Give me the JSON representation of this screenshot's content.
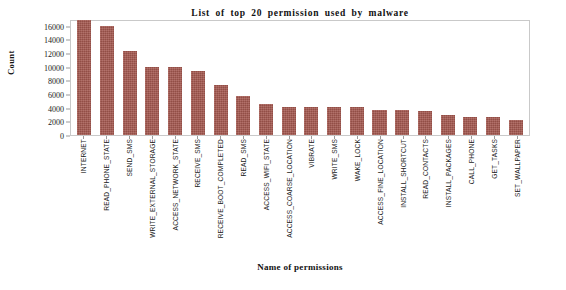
{
  "figure": {
    "background_color": "#ffffff",
    "frame_color": "#c9c9c9"
  },
  "chart_data": {
    "type": "bar",
    "title": "List  of  top  20  permission  used  by  malware",
    "xlabel": "Name of permissions",
    "ylabel": "Count",
    "ylim": [
      0,
      17000
    ],
    "yticks": [
      0,
      2000,
      4000,
      6000,
      8000,
      10000,
      12000,
      14000,
      16000
    ],
    "ytick_labels": [
      "0",
      "2000",
      "4000",
      "6000",
      "8000",
      "10000",
      "12000",
      "14000",
      "16000"
    ],
    "grid": false,
    "legend": null,
    "bar_color": "#a4574f",
    "categories": [
      "INTERNET",
      "READ_PHONE_STATE",
      "SEND_SMS",
      "WRITE_EXTERNAL_STORAGE",
      "ACCESS_NETWORK_STATE",
      "RECEIVE_SMS",
      "RECEIVE_BOOT_COMPLETED",
      "READ_SMS",
      "ACCESS_WIFI_STATE",
      "ACCESS_COARSE_LOCATION",
      "VIBRATE",
      "WRITE_SMS",
      "WAKE_LOCK",
      "ACCESS_FINE_LOCATION",
      "INSTALL_SHORTCUT",
      "READ_CONTACTS",
      "INSTALL_PACKAGES",
      "CALL_PHONE",
      "GET_TASKS",
      "SET_WALLPAPER"
    ],
    "values": [
      16800,
      16000,
      12300,
      9950,
      9900,
      9450,
      7350,
      5750,
      4600,
      4150,
      4150,
      4050,
      4050,
      3700,
      3650,
      3500,
      2900,
      2700,
      2650,
      2200
    ]
  }
}
